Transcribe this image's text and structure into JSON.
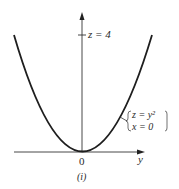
{
  "figure": {
    "z_tick_label": "z = 4",
    "origin_label": "0",
    "y_axis_label": "y",
    "caption": "(i)",
    "equation": {
      "line1": "z = y²",
      "line2": "x = 0"
    }
  },
  "colors": {
    "ink": "#1e1e1e",
    "background": "#ffffff"
  }
}
